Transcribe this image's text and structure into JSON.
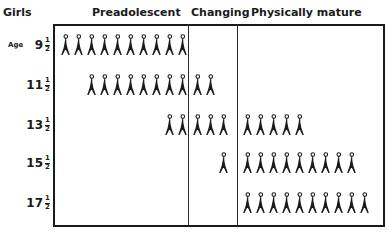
{
  "title": "Girls",
  "columns": [
    {
      "label": "Preadolescent"
    },
    {
      "label": "Changing"
    },
    {
      "label": "Physically mature"
    }
  ],
  "age_label": "Age",
  "rows": [
    {
      "whole": "9",
      "num": "1",
      "den": "2",
      "preadolescent": 10,
      "changing": 0,
      "mature": 0
    },
    {
      "whole": "11",
      "num": "1",
      "den": "2",
      "preadolescent": 8,
      "changing": 2,
      "mature": 0
    },
    {
      "whole": "13",
      "num": "1",
      "den": "2",
      "preadolescent": 2,
      "changing": 3,
      "mature": 5
    },
    {
      "whole": "15",
      "num": "1",
      "den": "2",
      "preadolescent": 0,
      "changing": 1,
      "mature": 9
    },
    {
      "whole": "17",
      "num": "1",
      "den": "2",
      "preadolescent": 0,
      "changing": 0,
      "mature": 10
    }
  ],
  "colors": {
    "ink": "#1a1a1a",
    "background": "#ffffff"
  },
  "chart_data": {
    "type": "table",
    "title": "Girls",
    "row_axis_label": "Age",
    "categories": [
      "9 1/2",
      "11 1/2",
      "13 1/2",
      "15 1/2",
      "17 1/2"
    ],
    "series": [
      {
        "name": "Preadolescent",
        "values": [
          10,
          8,
          2,
          0,
          0
        ]
      },
      {
        "name": "Changing",
        "values": [
          0,
          2,
          3,
          1,
          0
        ]
      },
      {
        "name": "Physically mature",
        "values": [
          0,
          0,
          5,
          9,
          10
        ]
      }
    ],
    "unit": "girl figures (out of 10 per age)"
  }
}
